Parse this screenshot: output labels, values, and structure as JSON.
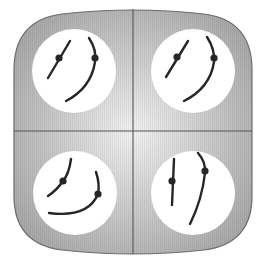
{
  "diagram": {
    "colors": {
      "background": "#ffffff",
      "frame_fill_center": "#f2f2f2",
      "frame_fill_edge": "#a9a9a9",
      "frame_stroke": "#6e6e6e",
      "divider": "#555555",
      "circle_fill": "#ffffff",
      "stroke": "#262626"
    },
    "quadrants": [
      {
        "id": "top-left",
        "circle": {
          "cx": 74,
          "cy": 71,
          "r": 42
        },
        "short_path": "M48 78 L70 41",
        "short_dot": {
          "cx": 59,
          "cy": 58
        },
        "long_path": "M89 38 Q97 50 95 62 Q91 88 66 101",
        "long_dot": {
          "cx": 95,
          "cy": 58
        }
      },
      {
        "id": "top-right",
        "circle": {
          "cx": 193,
          "cy": 71,
          "r": 42
        },
        "short_path": "M166 77 L188 41",
        "short_dot": {
          "cx": 177,
          "cy": 57
        },
        "long_path": "M207 37 Q215 49 214 62 Q210 88 184 101",
        "long_dot": {
          "cx": 214,
          "cy": 58
        }
      },
      {
        "id": "bottom-left",
        "circle": {
          "cx": 75,
          "cy": 193,
          "r": 42
        },
        "short_path": "M71 159 Q69 174 63 181 Q57 190 48 196",
        "short_dot": {
          "cx": 63,
          "cy": 181
        },
        "long_path": "M96 172 Q100 184 98 194 Q88 218 49 213",
        "long_dot": {
          "cx": 98,
          "cy": 194
        }
      },
      {
        "id": "bottom-right",
        "circle": {
          "cx": 193,
          "cy": 193,
          "r": 42
        },
        "short_path": "M174 159 L172 205",
        "short_dot": {
          "cx": 172,
          "cy": 181
        },
        "long_path": "M198 153 Q206 162 205 173 Q202 200 190 224",
        "long_dot": {
          "cx": 205,
          "cy": 171
        }
      }
    ]
  }
}
